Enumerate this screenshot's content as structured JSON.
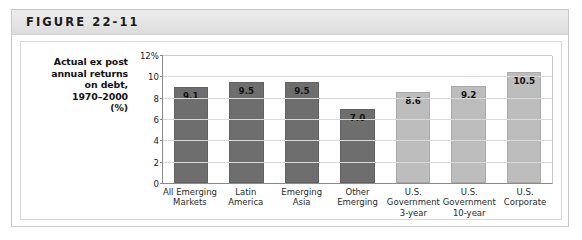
{
  "figure": {
    "header_label": "FIGURE 22-11",
    "caption_lines": [
      "Actual ex post",
      "annual returns",
      "on debt,",
      "1970–2000",
      "(%)"
    ]
  },
  "colors": {
    "bar_dark": "#6e6e6e",
    "bar_light": "#bdbdbd",
    "header_band": "#e6e6e6",
    "axis_line": "#8a8a8a",
    "gridline": "#d9d9d9"
  },
  "chart_data": {
    "type": "bar",
    "title": "Actual ex post annual returns on debt, 1970–2000 (%)",
    "xlabel": "",
    "ylabel": "Actual ex post annual returns on debt, 1970–2000 (%)",
    "ylim": [
      0,
      12
    ],
    "yticks": [
      0,
      2,
      4,
      6,
      8,
      10,
      12
    ],
    "ytick_labels": [
      "0",
      "2",
      "4",
      "6",
      "8",
      "10",
      "12%"
    ],
    "grid": true,
    "legend": "none",
    "categories": [
      [
        "All Emerging",
        "Markets"
      ],
      [
        "Latin",
        "America"
      ],
      [
        "Emerging",
        "Asia"
      ],
      [
        "Other",
        "Emerging"
      ],
      [
        "U.S.",
        "Government",
        "3-year"
      ],
      [
        "U.S.",
        "Government",
        "10-year"
      ],
      [
        "U.S.",
        "Corporate"
      ]
    ],
    "values": [
      9.1,
      9.5,
      9.5,
      7.0,
      8.6,
      9.2,
      10.5
    ],
    "value_labels": [
      "9.1",
      "9.5",
      "9.5",
      "7.0",
      "8.6",
      "9.2",
      "10.5"
    ],
    "bar_colors": [
      "#6e6e6e",
      "#6e6e6e",
      "#6e6e6e",
      "#6e6e6e",
      "#bdbdbd",
      "#bdbdbd",
      "#bdbdbd"
    ]
  }
}
